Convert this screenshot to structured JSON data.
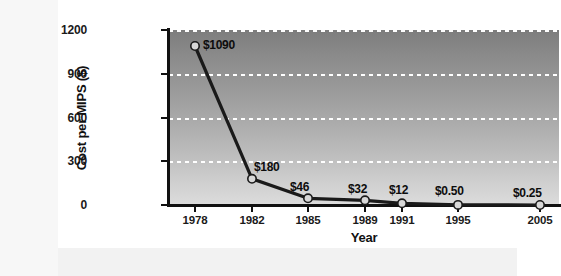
{
  "chart_data": {
    "type": "line",
    "title": "",
    "xlabel": "Year",
    "ylabel": "Cost per MIPS ($)",
    "categories": [
      "1978",
      "1982",
      "1985",
      "1989",
      "1991",
      "1995",
      "2005"
    ],
    "x": [
      1978,
      1982,
      1985,
      1989,
      1991,
      1995,
      2005
    ],
    "values": [
      1090,
      180,
      46,
      32,
      12,
      0.5,
      0.25
    ],
    "point_labels": [
      "$1090",
      "$180",
      "$46",
      "$32",
      "$12",
      "$0.50",
      "$0.25"
    ],
    "ylim": [
      0,
      1200
    ],
    "yticks": [
      0,
      300,
      600,
      900,
      1200
    ],
    "ytick_labels": [
      "0",
      "300",
      "600",
      "900",
      "1200"
    ],
    "grid": true,
    "grid_style": "dashed-white-horizontal",
    "legend": "none",
    "marker": "circle",
    "series": [
      {
        "name": "Cost per MIPS ($)",
        "values": [
          1090,
          180,
          46,
          32,
          12,
          0.5,
          0.25
        ]
      }
    ]
  },
  "colors": {
    "line": "#1a1a1a",
    "marker_fill": "#d8d8d8",
    "marker_edge": "#1a1a1a",
    "grid": "#ffffff",
    "axis": "#111111",
    "plot_bg_top": "#7d7d7d",
    "plot_bg_bottom": "#dcdcdc",
    "card_bg": "#ffffff",
    "page_bg": "#f2f2f2",
    "text": "#111111"
  },
  "ticks": {
    "y": [
      {
        "label": "1200",
        "value": 1200
      },
      {
        "label": "900",
        "value": 900
      },
      {
        "label": "600",
        "value": 600
      },
      {
        "label": "300",
        "value": 300
      },
      {
        "label": "0",
        "value": 0
      }
    ],
    "x": [
      {
        "label": "1978"
      },
      {
        "label": "1982"
      },
      {
        "label": "1985"
      },
      {
        "label": "1989"
      },
      {
        "label": "1991"
      },
      {
        "label": "1995"
      },
      {
        "label": "2005"
      }
    ]
  },
  "axis_titles": {
    "x": "Year",
    "y": "Cost per MIPS ($)"
  }
}
